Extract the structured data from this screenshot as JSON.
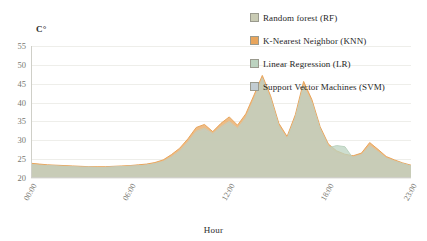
{
  "axis": {
    "y_unit": "C°",
    "y_ticks": [
      "55",
      "50",
      "45",
      "40",
      "35",
      "30",
      "25",
      "20"
    ],
    "x_ticks": [
      "00:00",
      "06:00",
      "12:00",
      "18:00",
      "23:00"
    ],
    "x_title": "Hour"
  },
  "legend": {
    "items": [
      {
        "label": "Random forest (RF)",
        "color": "#c9cbb4"
      },
      {
        "label": "K-Nearest Neighbor (KNN)",
        "color": "#e8a55c"
      },
      {
        "label": "Linear Regression (LR)",
        "color": "#bcd3c0"
      },
      {
        "label": "Support Vector Machines (SVM)",
        "color": "#c2ccd2"
      }
    ]
  },
  "chart_data": {
    "type": "area",
    "title": "",
    "xlabel": "Hour",
    "ylabel": "C°",
    "ylim": [
      20,
      55
    ],
    "grid": true,
    "legend_position": "top-right",
    "x": [
      "00:00",
      "00:30",
      "01:00",
      "01:30",
      "02:00",
      "02:30",
      "03:00",
      "03:30",
      "04:00",
      "04:30",
      "05:00",
      "05:30",
      "06:00",
      "06:30",
      "07:00",
      "07:30",
      "08:00",
      "08:30",
      "09:00",
      "09:30",
      "10:00",
      "10:30",
      "11:00",
      "11:30",
      "12:00",
      "12:30",
      "13:00",
      "13:30",
      "14:00",
      "14:30",
      "15:00",
      "15:30",
      "16:00",
      "16:30",
      "17:00",
      "17:30",
      "18:00",
      "18:30",
      "19:00",
      "19:30",
      "20:00",
      "20:30",
      "21:00",
      "21:30",
      "22:00",
      "22:30",
      "23:00"
    ],
    "series": [
      {
        "name": "Random forest (RF)",
        "color": "#c9cbb4",
        "values": [
          23.6,
          23.4,
          23.3,
          23.2,
          23.1,
          23.0,
          22.9,
          22.9,
          22.8,
          22.8,
          22.9,
          23.0,
          23.1,
          23.2,
          23.4,
          23.8,
          24.4,
          25.6,
          27.2,
          29.6,
          32.4,
          33.2,
          31.8,
          33.6,
          35.0,
          33.2,
          36.0,
          41.0,
          46.5,
          41.0,
          33.8,
          30.5,
          36.0,
          44.5,
          40.0,
          33.0,
          28.5,
          26.8,
          26.0,
          25.6,
          26.2,
          28.6,
          27.0,
          25.3,
          24.5,
          23.8,
          23.2
        ]
      },
      {
        "name": "K-Nearest Neighbor (KNN)",
        "color": "#e8a55c",
        "values": [
          23.9,
          23.7,
          23.5,
          23.4,
          23.3,
          23.2,
          23.1,
          23.0,
          23.0,
          23.0,
          23.1,
          23.2,
          23.3,
          23.5,
          23.7,
          24.1,
          24.8,
          26.2,
          27.9,
          30.4,
          33.4,
          34.2,
          32.3,
          34.5,
          36.2,
          34.0,
          37.0,
          42.0,
          47.2,
          41.8,
          34.5,
          31.0,
          36.8,
          45.6,
          40.8,
          33.6,
          29.0,
          27.2,
          26.3,
          25.9,
          26.6,
          29.4,
          27.6,
          25.7,
          24.8,
          24.0,
          23.4
        ]
      },
      {
        "name": "Linear Regression (LR)",
        "color": "#bcd3c0",
        "values": [
          23.4,
          23.2,
          23.1,
          23.0,
          22.9,
          22.8,
          22.8,
          22.7,
          22.7,
          22.7,
          22.8,
          22.9,
          23.0,
          23.1,
          23.3,
          23.6,
          24.1,
          25.2,
          26.6,
          28.9,
          31.6,
          32.4,
          31.2,
          32.8,
          34.2,
          32.6,
          35.2,
          40.2,
          45.6,
          40.2,
          33.2,
          30.0,
          35.2,
          43.6,
          39.2,
          32.4,
          28.0,
          28.6,
          28.3,
          25.2,
          25.8,
          28.0,
          26.6,
          25.0,
          24.2,
          23.6,
          23.0
        ]
      },
      {
        "name": "Support Vector Machines (SVM)",
        "color": "#c2ccd2",
        "values": [
          23.5,
          23.3,
          23.2,
          23.1,
          23.0,
          22.9,
          22.8,
          22.8,
          22.7,
          22.8,
          22.9,
          23.0,
          23.1,
          23.2,
          23.4,
          23.7,
          24.2,
          25.4,
          26.9,
          29.2,
          32.0,
          32.8,
          31.5,
          33.2,
          34.6,
          32.9,
          35.6,
          40.6,
          46.0,
          40.6,
          33.5,
          30.2,
          35.6,
          44.0,
          39.6,
          32.7,
          28.2,
          26.6,
          25.8,
          25.4,
          26.0,
          28.3,
          26.8,
          25.1,
          24.3,
          23.7,
          23.1
        ]
      }
    ]
  }
}
